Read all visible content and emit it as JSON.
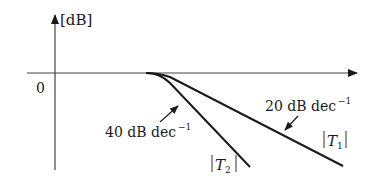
{
  "diagram": {
    "type": "bode-magnitude-asymptote",
    "y_axis_label": "[dB]",
    "origin_label": "0",
    "curves": [
      {
        "id": "T1",
        "label": "|T1|",
        "label_main": "T",
        "label_sub": "1",
        "slope_label": "20 dB dec",
        "slope_exp": "−1"
      },
      {
        "id": "T2",
        "label": "|T2|",
        "label_main": "T",
        "label_sub": "2",
        "slope_label": "40 dB dec",
        "slope_exp": "−1"
      }
    ]
  },
  "colors": {
    "line": "#1a1a1a",
    "axis": "#333333",
    "background": "#ffffff"
  }
}
